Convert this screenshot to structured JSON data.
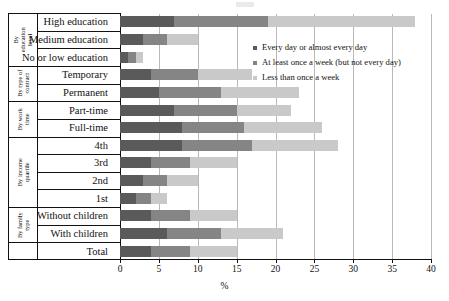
{
  "chart_data": {
    "type": "bar",
    "orientation": "horizontal",
    "stacked": true,
    "title": "",
    "xlabel": "%",
    "ylabel": "",
    "xlim": [
      0,
      40
    ],
    "xticks": [
      0,
      5,
      10,
      15,
      20,
      25,
      30,
      35,
      40
    ],
    "grid": true,
    "legend_position": "upper right inside",
    "categories": [
      "High education",
      "Medium education",
      "No or low education",
      "Temporary",
      "Permanent",
      "Part-time",
      "Full-time",
      "4th",
      "3rd",
      "2nd",
      "1st",
      "Without children",
      "With children",
      "Total"
    ],
    "series": [
      {
        "name": "Every day or almost every day",
        "color": "#5a5a5a",
        "values": [
          7,
          3,
          1,
          4,
          5,
          7,
          8,
          8,
          4,
          3,
          2,
          4,
          6,
          4
        ]
      },
      {
        "name": "At least once a week (but not every day)",
        "color": "#858585",
        "values": [
          12,
          3,
          1,
          6,
          8,
          8,
          8,
          9,
          5,
          3,
          2,
          5,
          7,
          5
        ]
      },
      {
        "name": "Less than once a week",
        "color": "#c9c9c9",
        "values": [
          19,
          4,
          1,
          7,
          10,
          7,
          10,
          11,
          6,
          4,
          2,
          6,
          8,
          6
        ]
      }
    ],
    "cumulative_totals": [
      38,
      10,
      3,
      17,
      23,
      22,
      26,
      28,
      15,
      10,
      6,
      15,
      21,
      15
    ],
    "groups": [
      {
        "label": "By education level",
        "categories": [
          "High education",
          "Medium education",
          "No or low education"
        ]
      },
      {
        "label": "By type of contract",
        "categories": [
          "Temporary",
          "Permanent"
        ]
      },
      {
        "label": "By work time",
        "categories": [
          "Part-time",
          "Full-time"
        ]
      },
      {
        "label": "By income quartile",
        "categories": [
          "4th",
          "3rd",
          "2nd",
          "1st"
        ]
      },
      {
        "label": "By family type",
        "categories": [
          "Without children",
          "With children"
        ]
      },
      {
        "label": "",
        "categories": [
          "Total"
        ]
      }
    ]
  },
  "legend": {
    "items": [
      {
        "label": "Every day or almost every day"
      },
      {
        "label": "At least once a week (but not every day)"
      },
      {
        "label": "Less than once a week"
      }
    ]
  },
  "axis": {
    "x_title": "%",
    "tick_labels": [
      "0",
      "5",
      "10",
      "15",
      "20",
      "25",
      "30",
      "35",
      "40"
    ]
  }
}
